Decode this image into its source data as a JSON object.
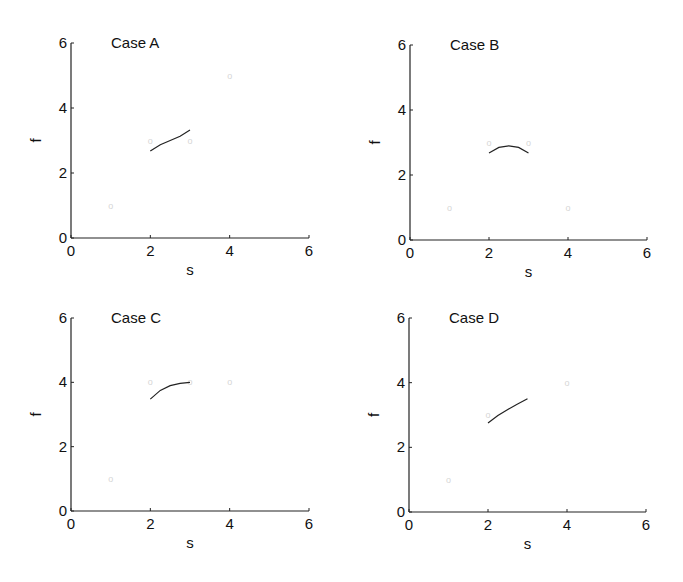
{
  "chart_data": [
    {
      "type": "scatter",
      "title": "Case A",
      "xlabel": "s",
      "ylabel": "f",
      "xlim": [
        0,
        6
      ],
      "ylim": [
        0,
        6
      ],
      "xticks": [
        0,
        2,
        4,
        6
      ],
      "yticks": [
        0,
        2,
        4,
        6
      ],
      "grid": false,
      "points": [
        [
          1,
          1
        ],
        [
          2,
          3
        ],
        [
          3,
          3
        ],
        [
          4,
          5
        ]
      ],
      "point_marker": "o",
      "curve": [
        [
          2,
          2.68
        ],
        [
          2.25,
          2.87
        ],
        [
          2.5,
          3.0
        ],
        [
          2.75,
          3.13
        ],
        [
          3,
          3.32
        ]
      ],
      "layout": {
        "x0": 71,
        "x6": 309,
        "y0": 238,
        "y6": 43
      }
    },
    {
      "type": "scatter",
      "title": "Case B",
      "xlabel": "s",
      "ylabel": "f",
      "xlim": [
        0,
        6
      ],
      "ylim": [
        0,
        6
      ],
      "xticks": [
        0,
        2,
        4,
        6
      ],
      "yticks": [
        0,
        2,
        4,
        6
      ],
      "grid": false,
      "points": [
        [
          1,
          1
        ],
        [
          2,
          3
        ],
        [
          3,
          3
        ],
        [
          4,
          1
        ]
      ],
      "point_marker": "o",
      "curve": [
        [
          2,
          2.68
        ],
        [
          2.25,
          2.85
        ],
        [
          2.5,
          2.9
        ],
        [
          2.75,
          2.85
        ],
        [
          3,
          2.68
        ]
      ],
      "layout": {
        "x0": 410,
        "x6": 647,
        "y0": 240,
        "y6": 45
      }
    },
    {
      "type": "scatter",
      "title": "Case C",
      "xlabel": "s",
      "ylabel": "f",
      "xlim": [
        0,
        6
      ],
      "ylim": [
        0,
        6
      ],
      "xticks": [
        0,
        2,
        4,
        6
      ],
      "yticks": [
        0,
        2,
        4,
        6
      ],
      "grid": false,
      "points": [
        [
          1,
          1
        ],
        [
          2,
          4
        ],
        [
          3,
          4
        ],
        [
          4,
          4
        ]
      ],
      "point_marker": "o",
      "curve": [
        [
          2,
          3.48
        ],
        [
          2.25,
          3.75
        ],
        [
          2.5,
          3.9
        ],
        [
          2.75,
          3.97
        ],
        [
          3,
          4.0
        ]
      ],
      "layout": {
        "x0": 71,
        "x6": 309,
        "y0": 511,
        "y6": 318
      }
    },
    {
      "type": "scatter",
      "title": "Case D",
      "xlabel": "s",
      "ylabel": "f",
      "xlim": [
        0,
        6
      ],
      "ylim": [
        0,
        6
      ],
      "xticks": [
        0,
        2,
        4,
        6
      ],
      "yticks": [
        0,
        2,
        4,
        6
      ],
      "grid": false,
      "points": [
        [
          1,
          1
        ],
        [
          2,
          3
        ],
        [
          4,
          4
        ]
      ],
      "point_marker": "o",
      "curve": [
        [
          2,
          2.75
        ],
        [
          2.25,
          2.98
        ],
        [
          2.5,
          3.17
        ],
        [
          2.75,
          3.34
        ],
        [
          3,
          3.5
        ]
      ],
      "layout": {
        "x0": 409,
        "x6": 646,
        "y0": 512,
        "y6": 318
      }
    }
  ]
}
